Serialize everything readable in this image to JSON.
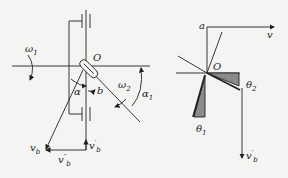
{
  "diagram": {
    "left_labels": {
      "omega1": "ω",
      "omega1_sub": "1",
      "origin": "O",
      "alpha": "α",
      "b": "b",
      "omega2": "ω",
      "omega2_sub": "2",
      "alpha1": "α",
      "alpha1_sub": "1",
      "vb": "v",
      "vb_sub": "b",
      "vb_dbl": "v",
      "vb_dbl_sub": "b",
      "vb_dbl_sup": "″",
      "vb_prime": "v",
      "vb_prime_sub": "b",
      "vb_prime_sup": "′"
    },
    "right_labels": {
      "a": "a",
      "v": "v",
      "origin": "O",
      "theta2": "θ",
      "theta2_sub": "2",
      "theta1": "θ",
      "theta1_sub": "1",
      "vb_prime": "v",
      "vb_prime_sub": "b",
      "vb_prime_sup": "′"
    },
    "colors": {
      "line": "#222222",
      "fill": "#8a8a8a",
      "background": "#f4f4f2"
    }
  }
}
